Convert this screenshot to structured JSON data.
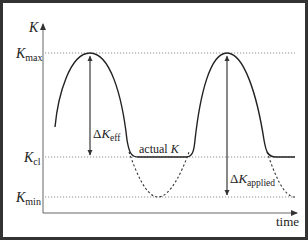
{
  "diagram": {
    "axes": {
      "y_label": "K",
      "x_label": "time"
    },
    "levels": {
      "k_max": {
        "base": "K",
        "sub": "max"
      },
      "k_cl": {
        "base": "K",
        "sub": "cl"
      },
      "k_min": {
        "base": "K",
        "sub": "min"
      }
    },
    "annotations": {
      "delta_k_eff": {
        "delta": "Δ",
        "base": "K",
        "sub": "eff"
      },
      "delta_k_applied": {
        "delta": "Δ",
        "base": "K",
        "sub": "applied"
      },
      "actual_k": {
        "text": "actual ",
        "var": "K"
      }
    },
    "styles": {
      "curve_color": "#222222",
      "axis_color": "#555555",
      "guide_color": "#666666",
      "border_color": "#333333"
    }
  }
}
